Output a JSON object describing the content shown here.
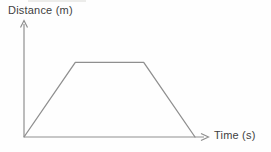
{
  "chart_data": {
    "type": "line",
    "title": "",
    "xlabel": "Time (s)",
    "ylabel": "Distance (m)",
    "series": [
      {
        "name": "distance-vs-time",
        "x_norm": [
          0,
          0.3,
          0.7,
          1
        ],
        "y_norm": [
          0,
          0.66,
          0.66,
          0
        ]
      }
    ],
    "shape_description": "Distance rises linearly from zero, stays constant, then falls linearly back to zero (trapezoid).",
    "x_ticks": [],
    "y_ticks": [],
    "xlim": [
      0,
      1
    ],
    "ylim": [
      0,
      1
    ],
    "grid": false,
    "legend": false,
    "axes_have_arrows": true
  },
  "colors": {
    "line": "#8f8f8f",
    "axis": "#8f8f8f",
    "text": "#3f3f3f",
    "background": "#fefefe"
  }
}
